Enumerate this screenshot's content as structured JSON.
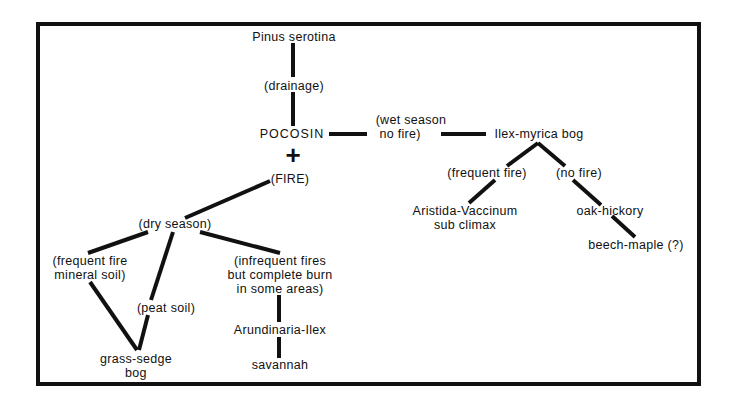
{
  "diagram": {
    "nodes": {
      "pinus": "Pinus serotina",
      "drainage": "(drainage)",
      "pocosin": "POCOSIN",
      "plus": "+",
      "fire": "(FIRE)",
      "wet_season": "(wet season\n no fire)",
      "ilex_myrica": "Ilex-myrica bog",
      "frequent_fire_right": "(frequent fire)",
      "no_fire": "(no fire)",
      "aristida": "Aristida-Vaccinum\nsub climax",
      "oak_hickory": "oak-hickory",
      "beech_maple": "beech-maple (?)",
      "dry_season": "(dry season)",
      "frequent_fire_mineral": "(frequent fire\nmineral soil)",
      "peat_soil": "(peat soil)",
      "infrequent_fires": "(infrequent fires\nbut complete burn\nin some areas)",
      "grass_sedge": "grass-sedge\nbog",
      "arundinaria": "Arundinaria-Ilex",
      "savannah": "savannah"
    },
    "line_color": "#111111"
  }
}
